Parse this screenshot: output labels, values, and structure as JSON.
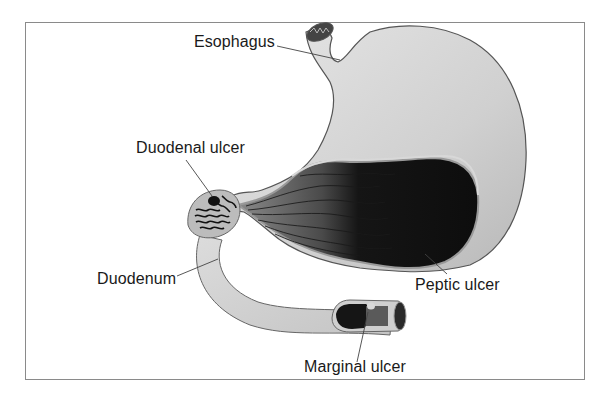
{
  "diagram": {
    "labels": {
      "esophagus": "Esophagus",
      "duodenal_ulcer": "Duodenal ulcer",
      "duodenum": "Duodenum",
      "peptic_ulcer": "Peptic ulcer",
      "marginal_ulcer": "Marginal ulcer"
    },
    "colors": {
      "frame": "#8a8a8a",
      "stomach_wall": "#d4d4d4",
      "stomach_interior_dark": "#111111",
      "mucosa_mid": "#6e6e6e",
      "outline": "#555555",
      "text": "#1a1a1a"
    }
  }
}
